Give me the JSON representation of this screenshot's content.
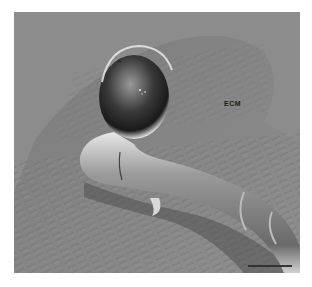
{
  "figure": {
    "type": "SEM micrograph",
    "labels": {
      "appressorium": "A",
      "matrix": "ECM"
    },
    "scale_bar": {
      "visible": true,
      "label": ""
    },
    "colors": {
      "background": "#8a8a8a",
      "frame": "#ffffff",
      "scale_bar": "#333333"
    }
  }
}
